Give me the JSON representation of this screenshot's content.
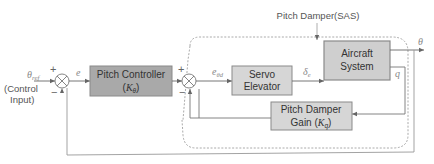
{
  "diagram": {
    "type": "block-diagram",
    "input": {
      "symbol": "θ",
      "subscript": "ref",
      "description_line1": "(Control",
      "description_line2": "Input)"
    },
    "blocks": [
      {
        "id": "pitch-controller",
        "line1": "Pitch Controller",
        "line2_pre": "(",
        "line2_sym": "K",
        "line2_sub": "θ",
        "line2_post": ")",
        "fill": "#a9a9a9"
      },
      {
        "id": "servo-elevator",
        "line1": "Servo",
        "line2": "Elevator",
        "fill": "#d6d6d6"
      },
      {
        "id": "aircraft-system",
        "line1": "Aircraft",
        "line2": "System",
        "fill": "#cfcfcf"
      },
      {
        "id": "pitch-damper-gain",
        "line1": "Pitch Damper",
        "line2_pre": "Gain (",
        "line2_sym": "K",
        "line2_sub": "q",
        "line2_post": ")",
        "fill": "#d6d6d6"
      }
    ],
    "summing_junctions": [
      {
        "id": "outer-sum",
        "plus": "+",
        "minus": "−"
      },
      {
        "id": "inner-sum",
        "plus": "+",
        "minus": "−"
      }
    ],
    "signals": {
      "error": "e",
      "inner_error": "e",
      "inner_error_sub": "θd",
      "elevator_deflection": "δ",
      "elevator_deflection_sub": "e",
      "output_pitch": "θ",
      "pitch_rate": "q"
    },
    "group_label": "Pitch Damper(SAS)",
    "colors": {
      "line": "#777777",
      "dashed_border": "#999999",
      "block_border": "#8a8a8a"
    }
  }
}
